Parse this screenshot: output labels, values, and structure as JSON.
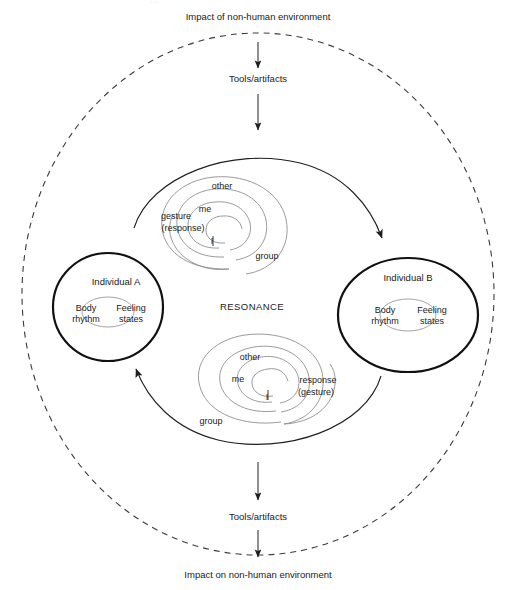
{
  "diagram": {
    "title_cropped": "...",
    "environment": {
      "top_impact_label": "Impact of non-human environment",
      "top_tools_label": "Tools/artifacts",
      "bottom_tools_label": "Tools/artifacts",
      "bottom_impact_label": "Impact on non-human environment"
    },
    "center_label": "RESONANCE",
    "individuals": [
      {
        "id": "individual-a",
        "title": "Individual A",
        "left_label_line1": "Body",
        "left_label_line2": "rhythm",
        "right_label_line1": "Feeling",
        "right_label_line2": "states"
      },
      {
        "id": "individual-b",
        "title": "Individual B",
        "left_label_line1": "Body",
        "left_label_line2": "rhythm",
        "right_label_line1": "Feeling",
        "right_label_line2": "states"
      }
    ],
    "spirals": [
      {
        "id": "spiral-top",
        "direction": "a-to-b",
        "labels": {
          "other": "other",
          "me": "me",
          "i": "I",
          "group": "group",
          "action_line1": "gesture",
          "action_line2": "(response)"
        }
      },
      {
        "id": "spiral-bottom",
        "direction": "b-to-a",
        "labels": {
          "other": "other",
          "me": "me",
          "i": "I",
          "group": "group",
          "action_line1": "response",
          "action_line2": "(gesture)"
        }
      }
    ],
    "colors": {
      "ink": "#1a1a1a",
      "individual_stroke": "#111111",
      "spiral_stroke": "#8e8e8e",
      "dashed_stroke": "#3a3a3a",
      "background": "#ffffff"
    }
  }
}
